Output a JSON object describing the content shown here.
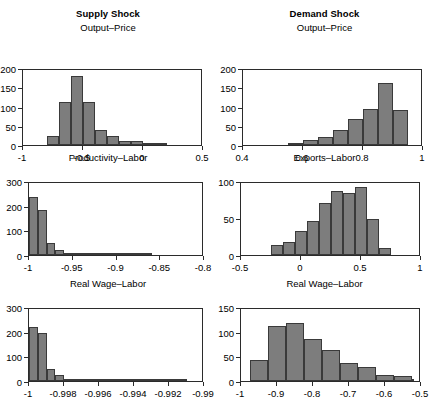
{
  "figure": {
    "column_titles": [
      "Supply Shock",
      "Demand Shock"
    ],
    "background_color": "#ffffff",
    "bar_fill_color": "#7d7d7d",
    "bar_edge_color": "#3a3a3a",
    "axis_color": "#2b2b2b"
  },
  "chart_data": [
    {
      "type": "bar",
      "panel_id": "supply-output-price",
      "title": "Output–Price",
      "column_title": "Supply Shock",
      "xlabel": "",
      "ylabel": "",
      "xlim": [
        -1,
        0.5
      ],
      "ylim": [
        0,
        200
      ],
      "grid": false,
      "legend": null,
      "xticks": [
        -1,
        -0.5,
        0,
        0.5
      ],
      "xtick_labels": [
        "-1",
        "-0.5",
        "0",
        "0.5"
      ],
      "yticks": [
        0,
        50,
        100,
        150,
        200
      ],
      "ytick_labels": [
        "0",
        "50",
        "100",
        "150",
        "200"
      ],
      "bin_edges": [
        -0.8,
        -0.7,
        -0.6,
        -0.5,
        -0.4,
        -0.3,
        -0.2,
        -0.1,
        0.0,
        0.1,
        0.2
      ],
      "values": [
        23,
        113,
        179,
        113,
        39,
        23,
        10,
        10,
        3,
        3
      ]
    },
    {
      "type": "bar",
      "panel_id": "demand-output-price",
      "title": "Output–Price",
      "column_title": "Demand Shock",
      "xlabel": "",
      "ylabel": "",
      "xlim": [
        0.4,
        1.0
      ],
      "ylim": [
        0,
        200
      ],
      "grid": false,
      "legend": null,
      "xticks": [
        0.4,
        0.6,
        0.8,
        1.0
      ],
      "xtick_labels": [
        "0.4",
        "0.6",
        "0.8",
        "1"
      ],
      "yticks": [
        0,
        50,
        100,
        150,
        200
      ],
      "ytick_labels": [
        "0",
        "50",
        "100",
        "150",
        "200"
      ],
      "bin_edges": [
        0.55,
        0.6,
        0.65,
        0.7,
        0.75,
        0.8,
        0.85,
        0.9,
        0.95,
        1.0
      ],
      "values": [
        5,
        12,
        21,
        38,
        67,
        94,
        160,
        91,
        0
      ]
    },
    {
      "type": "bar",
      "panel_id": "supply-productivity-labor",
      "title": "Productivity–Labor",
      "column_title": "Supply Shock",
      "xlabel": "",
      "ylabel": "",
      "xlim": [
        -1.0,
        -0.8
      ],
      "ylim": [
        0,
        300
      ],
      "grid": false,
      "legend": null,
      "xticks": [
        -1.0,
        -0.95,
        -0.9,
        -0.85,
        -0.8
      ],
      "xtick_labels": [
        "-1",
        "-0.95",
        "-0.9",
        "-0.85",
        "-0.8"
      ],
      "yticks": [
        0,
        100,
        200,
        300
      ],
      "ytick_labels": [
        "0",
        "100",
        "200",
        "300"
      ],
      "bin_edges": [
        -1.0,
        -0.99,
        -0.98,
        -0.97,
        -0.96,
        -0.95,
        -0.94,
        -0.93,
        -0.92,
        -0.91,
        -0.9,
        -0.89,
        -0.88,
        -0.87,
        -0.86
      ],
      "values": [
        234,
        184,
        48,
        22,
        7,
        5,
        3,
        2,
        2,
        2,
        2,
        4,
        3,
        2
      ]
    },
    {
      "type": "bar",
      "panel_id": "demand-exports-labor",
      "title": "Exports–Labor",
      "column_title": "Demand Shock",
      "xlabel": "",
      "ylabel": "",
      "xlim": [
        -0.5,
        1.0
      ],
      "ylim": [
        0,
        100
      ],
      "grid": false,
      "legend": null,
      "xticks": [
        -0.5,
        0,
        0.5,
        1.0
      ],
      "xtick_labels": [
        "-0.5",
        "0",
        "0.5",
        "1"
      ],
      "yticks": [
        0,
        50,
        100
      ],
      "ytick_labels": [
        "0",
        "50",
        "100"
      ],
      "bin_edges": [
        -0.25,
        -0.15,
        -0.05,
        0.05,
        0.15,
        0.25,
        0.35,
        0.45,
        0.55,
        0.65,
        0.75
      ],
      "values": [
        13,
        18,
        33,
        46,
        70,
        87,
        84,
        92,
        49,
        10
      ]
    },
    {
      "type": "bar",
      "panel_id": "supply-real-wage-labor",
      "title": "Real Wage–Labor",
      "column_title": "Supply Shock",
      "xlabel": "",
      "ylabel": "",
      "xlim": [
        -1.0,
        -0.99
      ],
      "ylim": [
        0,
        300
      ],
      "grid": false,
      "legend": null,
      "xticks": [
        -1.0,
        -0.998,
        -0.996,
        -0.994,
        -0.992,
        -0.99
      ],
      "xtick_labels": [
        "-1",
        "-0.998",
        "-0.996",
        "-0.994",
        "-0.992",
        "-0.99"
      ],
      "yticks": [
        0,
        100,
        200,
        300
      ],
      "ytick_labels": [
        "0",
        "100",
        "200",
        "300"
      ],
      "bin_edges": [
        -1.0,
        -0.9995,
        -0.999,
        -0.9985,
        -0.998,
        -0.9975,
        -0.997,
        -0.9965,
        -0.996,
        -0.9955,
        -0.995,
        -0.9945,
        -0.994,
        -0.9935,
        -0.993,
        -0.9925,
        -0.992,
        -0.9915,
        -0.991
      ],
      "values": [
        219,
        196,
        47,
        23,
        8,
        4,
        3,
        2,
        2,
        2,
        2,
        2,
        3,
        2,
        2,
        3,
        4,
        2
      ]
    },
    {
      "type": "bar",
      "panel_id": "demand-real-wage-labor",
      "title": "Real Wage–Labor",
      "column_title": "Demand Shock",
      "xlabel": "",
      "ylabel": "",
      "xlim": [
        -1.0,
        -0.5
      ],
      "ylim": [
        0,
        150
      ],
      "grid": false,
      "legend": null,
      "xticks": [
        -1.0,
        -0.9,
        -0.8,
        -0.7,
        -0.6,
        -0.5
      ],
      "xtick_labels": [
        "-1",
        "-0.9",
        "-0.8",
        "-0.7",
        "-0.6",
        "-0.5"
      ],
      "yticks": [
        0,
        50,
        100,
        150
      ],
      "ytick_labels": [
        "0",
        "50",
        "100",
        "150"
      ],
      "bin_edges": [
        -0.975,
        -0.925,
        -0.875,
        -0.825,
        -0.775,
        -0.725,
        -0.675,
        -0.625,
        -0.575,
        -0.525
      ],
      "values": [
        43,
        112,
        117,
        86,
        62,
        37,
        29,
        13,
        10,
        3
      ]
    }
  ]
}
